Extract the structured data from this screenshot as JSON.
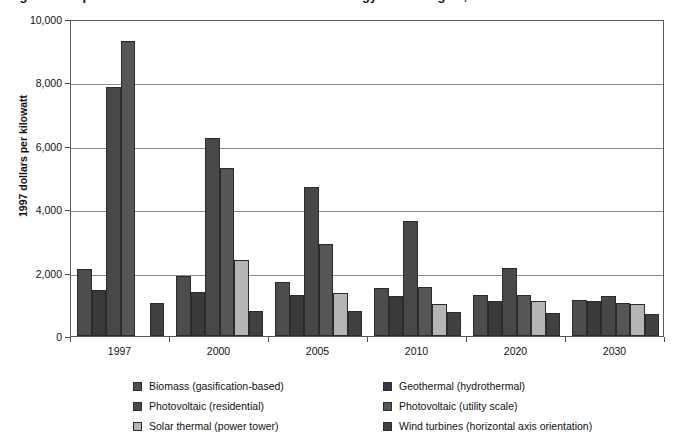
{
  "title": {
    "text": "Figure 5. Capital Cost Estimates for New Renewable Energy Technologies, 1997-2030",
    "clipped": true
  },
  "chart_data": {
    "type": "bar",
    "title": "",
    "xlabel": "",
    "ylabel": "1997 dollars per kilowatt",
    "ylim": [
      0,
      10000
    ],
    "ytick_labels": [
      "0",
      "2,000",
      "4,000",
      "6,000",
      "8,000",
      "10,000"
    ],
    "ytick_values": [
      0,
      2000,
      4000,
      6000,
      8000,
      10000
    ],
    "grid": "horizontal",
    "legend_position": "bottom",
    "categories": [
      "1997",
      "2000",
      "2005",
      "2010",
      "2020",
      "2030"
    ],
    "series": [
      {
        "name": "Biomass (gasification-based)",
        "color": "#4d4d4d",
        "values": [
          2100,
          1900,
          1700,
          1500,
          1300,
          1150
        ]
      },
      {
        "name": "Geothermal (hydrothermal)",
        "color": "#3a3a3a",
        "values": [
          1450,
          1400,
          1300,
          1250,
          1100,
          1120
        ]
      },
      {
        "name": "Photovoltaic (residential)",
        "color": "#484848",
        "values": [
          7850,
          6250,
          4700,
          3620,
          2130,
          1250
        ]
      },
      {
        "name": "Photovoltaic (utility scale)",
        "color": "#565656",
        "values": [
          9300,
          5300,
          2900,
          1550,
          1300,
          1050
        ]
      },
      {
        "name": "Solar thermal (power tower)",
        "color": "#b5b5b5",
        "values": [
          null,
          2400,
          1350,
          1020,
          1100,
          1000
        ]
      },
      {
        "name": "Wind turbines (horizontal axis orientation)",
        "color": "#414141",
        "values": [
          1050,
          800,
          780,
          750,
          730,
          700
        ]
      }
    ]
  }
}
